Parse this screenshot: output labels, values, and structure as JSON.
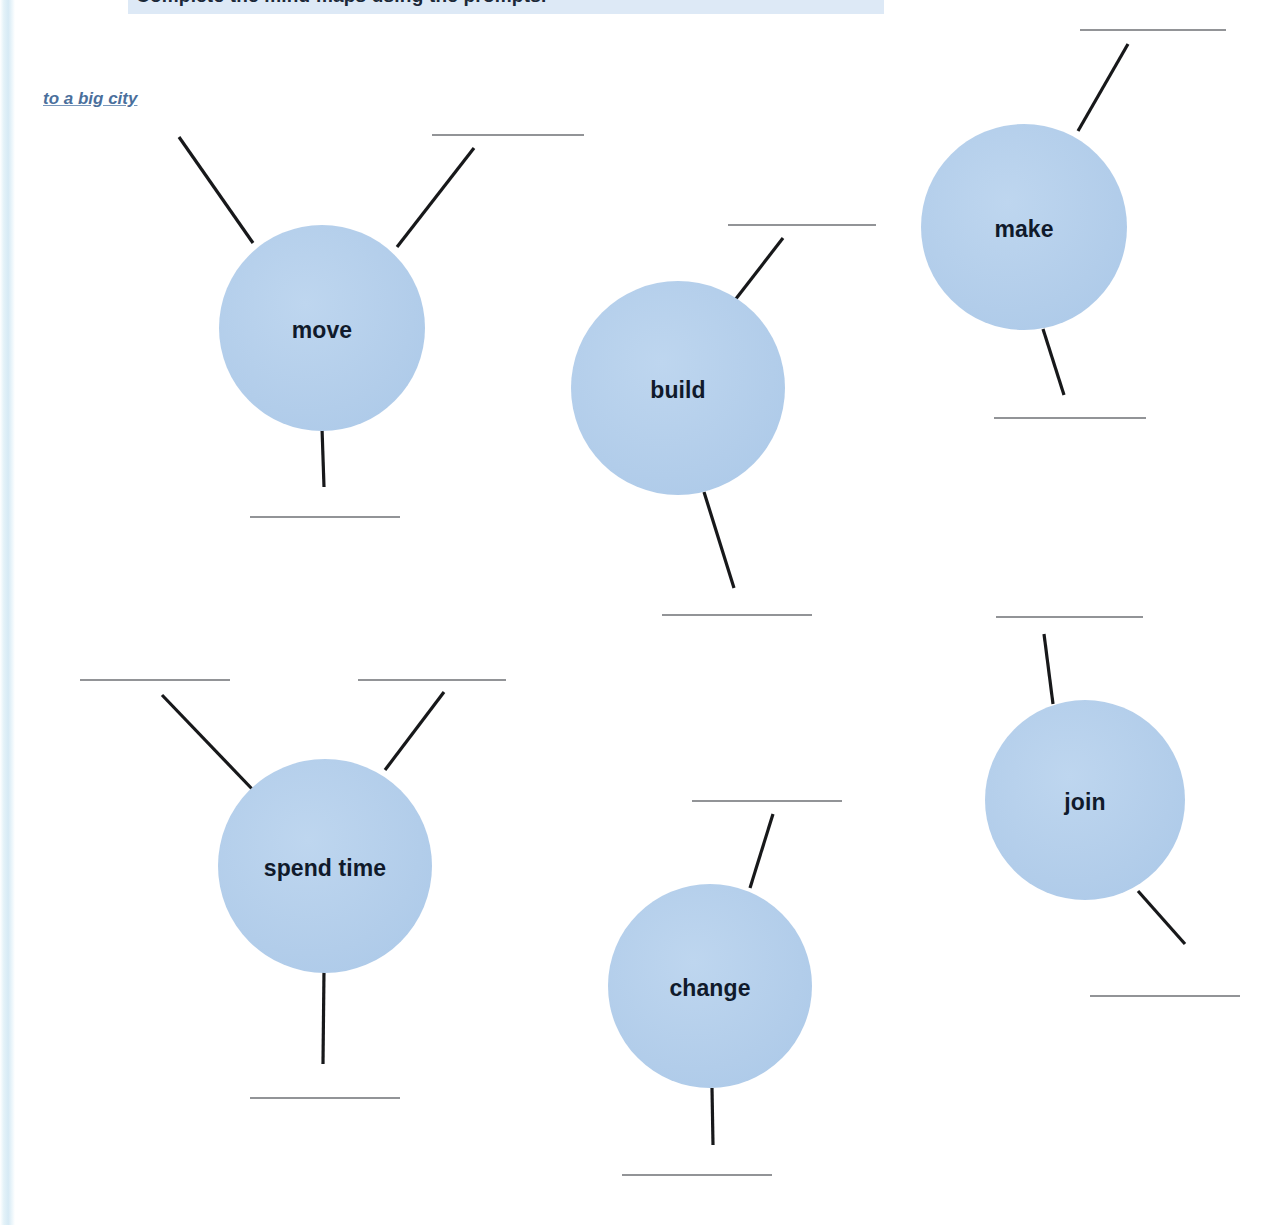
{
  "banner": {
    "text": "Complete the mind maps using the prompts."
  },
  "hint": {
    "text": "to a big city"
  },
  "colors": {
    "bubble_fill": "#b6d0ec",
    "bubble_text": "#101a2b",
    "connector_stroke": "#17181a",
    "blank_line": "#6e7174",
    "hint_text": "#4a6f9c",
    "banner_fill": "#dde9f6",
    "left_strip": "#cfe6f3",
    "page_background": "#ffffff"
  },
  "bubbles": [
    {
      "id": "move",
      "label": "move",
      "cx": 322,
      "cy": 328,
      "r": 103
    },
    {
      "id": "build",
      "label": "build",
      "cx": 678,
      "cy": 388,
      "r": 107
    },
    {
      "id": "make",
      "label": "make",
      "cx": 1024,
      "cy": 227,
      "r": 103
    },
    {
      "id": "spend-time",
      "label": "spend time",
      "cx": 325,
      "cy": 866,
      "r": 107
    },
    {
      "id": "change",
      "label": "change",
      "cx": 710,
      "cy": 986,
      "r": 102
    },
    {
      "id": "join",
      "label": "join",
      "cx": 1085,
      "cy": 800,
      "r": 100
    }
  ],
  "connectors": [
    {
      "id": "move-upper-left",
      "bubble": "move",
      "x1": 179,
      "y1": 137,
      "x2": 253,
      "y2": 243
    },
    {
      "id": "move-upper-right",
      "bubble": "move",
      "x1": 474,
      "y1": 148,
      "x2": 397,
      "y2": 247
    },
    {
      "id": "move-bottom",
      "bubble": "move",
      "x1": 322,
      "y1": 428,
      "x2": 324,
      "y2": 487
    },
    {
      "id": "build-upper-right",
      "bubble": "build",
      "x1": 783,
      "y1": 238,
      "x2": 735,
      "y2": 300
    },
    {
      "id": "build-bottom-right",
      "bubble": "build",
      "x1": 704,
      "y1": 492,
      "x2": 734,
      "y2": 588
    },
    {
      "id": "make-upper-right",
      "bubble": "make",
      "x1": 1128,
      "y1": 44,
      "x2": 1078,
      "y2": 131
    },
    {
      "id": "make-bottom",
      "bubble": "make",
      "x1": 1043,
      "y1": 329,
      "x2": 1064,
      "y2": 395
    },
    {
      "id": "spend-time-upper-left",
      "bubble": "spend-time",
      "x1": 162,
      "y1": 695,
      "x2": 254,
      "y2": 791
    },
    {
      "id": "spend-time-upper-right",
      "bubble": "spend-time",
      "x1": 444,
      "y1": 692,
      "x2": 385,
      "y2": 770
    },
    {
      "id": "spend-time-bottom",
      "bubble": "spend-time",
      "x1": 324,
      "y1": 969,
      "x2": 323,
      "y2": 1064
    },
    {
      "id": "change-upper-right",
      "bubble": "change",
      "x1": 773,
      "y1": 814,
      "x2": 750,
      "y2": 888
    },
    {
      "id": "change-bottom",
      "bubble": "change",
      "x1": 712,
      "y1": 1088,
      "x2": 713,
      "y2": 1145
    },
    {
      "id": "join-upper-left",
      "bubble": "join",
      "x1": 1044,
      "y1": 634,
      "x2": 1053,
      "y2": 704
    },
    {
      "id": "join-bottom-right",
      "bubble": "join",
      "x1": 1138,
      "y1": 891,
      "x2": 1185,
      "y2": 944
    }
  ],
  "answer_blanks": [
    {
      "id": "blank-move-upper-right",
      "x1": 432,
      "y1": 135,
      "x2": 584
    },
    {
      "id": "blank-move-bottom",
      "x1": 250,
      "y1": 517,
      "x2": 400
    },
    {
      "id": "blank-build-upper",
      "x1": 728,
      "y1": 225,
      "x2": 876
    },
    {
      "id": "blank-build-bottom",
      "x1": 662,
      "y1": 615,
      "x2": 812
    },
    {
      "id": "blank-make-upper",
      "x1": 1080,
      "y1": 30,
      "x2": 1226
    },
    {
      "id": "blank-make-bottom",
      "x1": 994,
      "y1": 418,
      "x2": 1146
    },
    {
      "id": "blank-spend-upper-left",
      "x1": 80,
      "y1": 680,
      "x2": 230
    },
    {
      "id": "blank-spend-upper-right",
      "x1": 358,
      "y1": 680,
      "x2": 506
    },
    {
      "id": "blank-spend-bottom",
      "x1": 250,
      "y1": 1098,
      "x2": 400
    },
    {
      "id": "blank-change-upper",
      "x1": 692,
      "y1": 801,
      "x2": 842
    },
    {
      "id": "blank-change-bottom",
      "x1": 622,
      "y1": 1175,
      "x2": 772
    },
    {
      "id": "blank-join-upper",
      "x1": 996,
      "y1": 617,
      "x2": 1143
    },
    {
      "id": "blank-join-bottom",
      "x1": 1090,
      "y1": 996,
      "x2": 1240
    }
  ]
}
